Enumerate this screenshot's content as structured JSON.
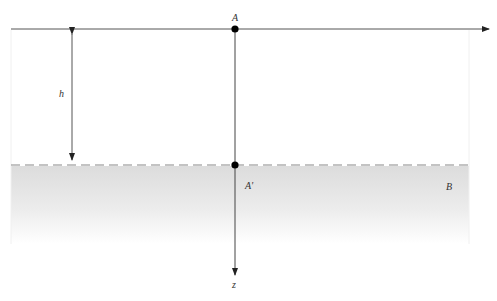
{
  "diagram": {
    "labels": {
      "top_point": "A",
      "surface_point": "A'",
      "height": "h",
      "region": "B",
      "axis": "z"
    },
    "colors": {
      "line": "#555555",
      "axis_line": "#444444",
      "point": "#000000",
      "dash": "#888888",
      "shade_top": "#dedede",
      "shade_bottom": "#ffffff"
    }
  }
}
